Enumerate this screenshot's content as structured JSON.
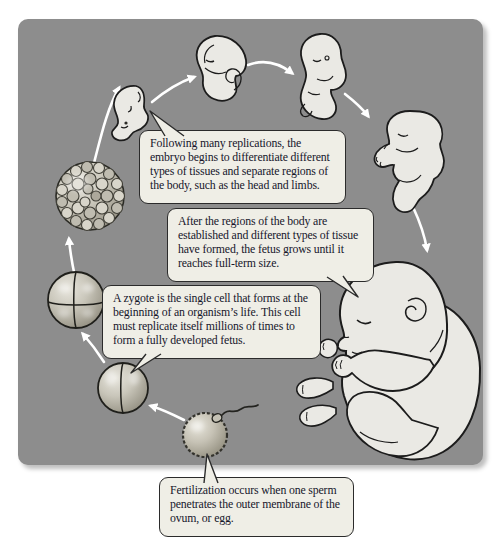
{
  "diagram": {
    "name": "human-development-cycle",
    "background_color": "#ffffff",
    "panel_color": "#8d8d8d",
    "arrow_color": "#ffffff",
    "figure_fill_color": "#eae9e4",
    "outline_color": "#1c1c1c",
    "bubble_fill_color": "#efeee6",
    "bubble_border_color": "#2b2b2b",
    "text_color": "#16162b"
  },
  "captions": {
    "differentiation": "Following many replications, the embryo begins to differentiate different types of tissues and separate regions of the body, such as the head and limbs.",
    "fetal_growth": "After the regions of the body are established and different types of tissue have formed, the fetus grows until it reaches full-term size.",
    "zygote": "A zygote is the single cell that forms at the beginning of an organism’s life. This cell must replicate itself millions of times to form a fully developed fetus.",
    "fertilization": "Fertilization occurs when one sperm penetrates the outer membrane of the ovum, or egg."
  },
  "stages": [
    {
      "icon": "fertilized-egg-with-sperm-icon"
    },
    {
      "icon": "two-cell-zygote-icon"
    },
    {
      "icon": "four-cell-stage-icon"
    },
    {
      "icon": "morula-cell-ball-icon"
    },
    {
      "icon": "early-embryo-icon"
    },
    {
      "icon": "mid-embryo-icon"
    },
    {
      "icon": "late-embryo-icon"
    },
    {
      "icon": "fetus-icon"
    },
    {
      "icon": "full-term-baby-icon"
    }
  ]
}
